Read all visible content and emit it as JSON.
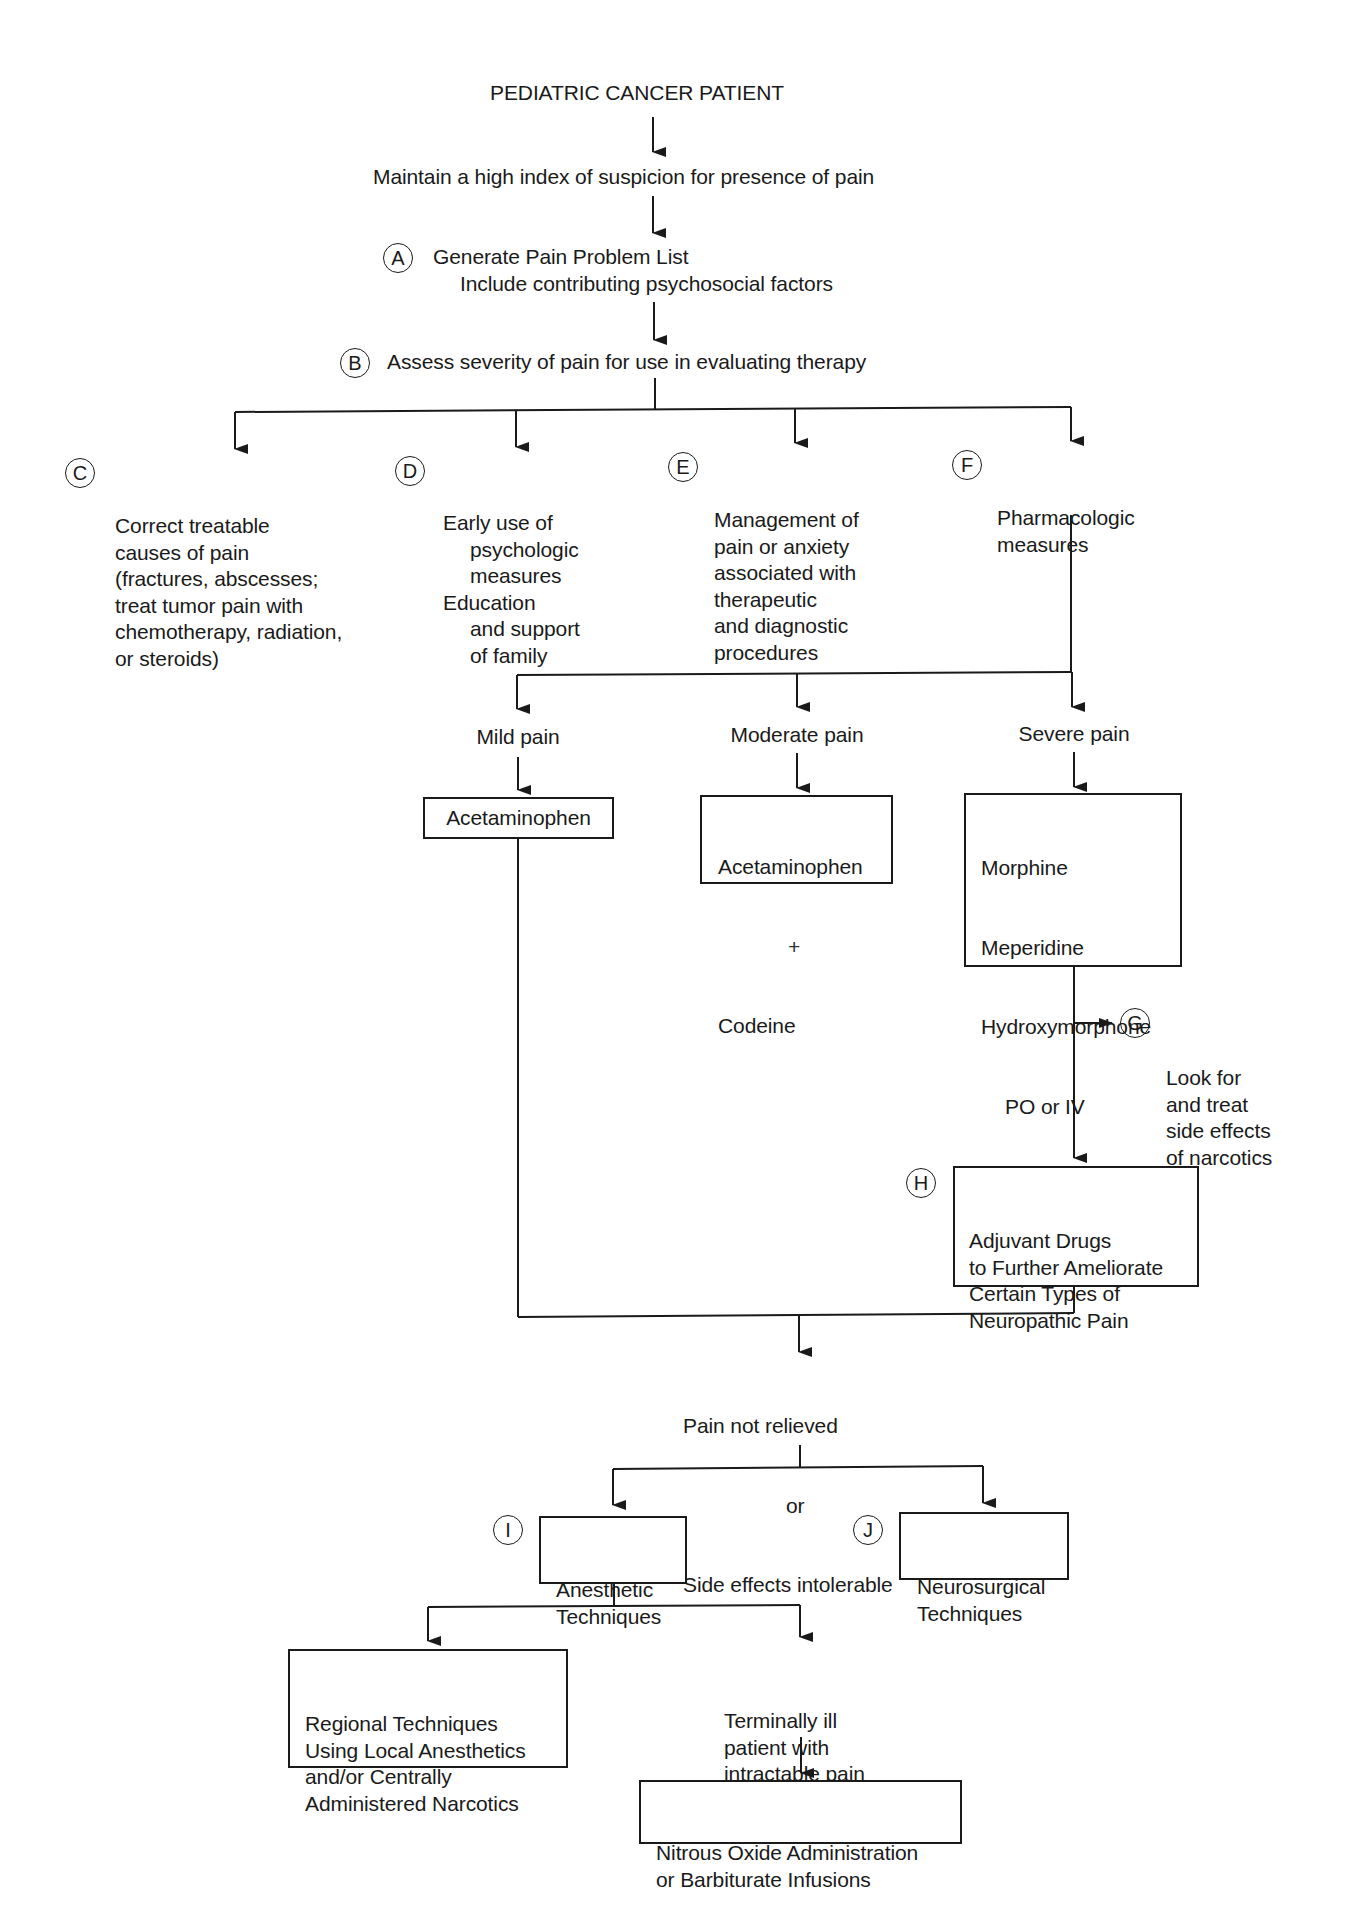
{
  "diagram": {
    "title": "PEDIATRIC CANCER PATIENT",
    "step_index": "Maintain a high index of suspicion for presence of pain",
    "A": {
      "label": "A",
      "line1": "Generate Pain Problem List",
      "line2": "Include contributing psychosocial factors"
    },
    "B": {
      "label": "B",
      "text": "Assess severity of pain for use in evaluating therapy"
    },
    "C": {
      "label": "C",
      "lines": [
        "Correct treatable",
        "causes of pain",
        "(fractures, abscesses;",
        "treat tumor pain with",
        "chemotherapy, radiation,",
        "or steroids)"
      ]
    },
    "D": {
      "label": "D",
      "lines": [
        "Early use of",
        "psychologic",
        "measures",
        "Education",
        "and support",
        "of family"
      ]
    },
    "E": {
      "label": "E",
      "lines": [
        "Management of",
        "pain or anxiety",
        "associated with",
        "therapeutic",
        "and diagnostic",
        "procedures"
      ]
    },
    "F": {
      "label": "F",
      "lines": [
        "Pharmacologic",
        "measures"
      ]
    },
    "severity": {
      "mild": {
        "label": "Mild pain",
        "drug": "Acetaminophen"
      },
      "moderate": {
        "label": "Moderate pain",
        "drug_lines": [
          "Acetaminophen",
          "+",
          "Codeine"
        ]
      },
      "severe": {
        "label": "Severe pain",
        "drug_lines": [
          "Morphine",
          "Meperidine",
          "Hydroxymorphone",
          "PO or IV",
          "or",
          "Fentanyl IV"
        ]
      }
    },
    "G": {
      "label": "G",
      "lines": [
        "Look for",
        "and treat",
        "side effects",
        "of narcotics"
      ]
    },
    "H": {
      "label": "H",
      "lines": [
        "Adjuvant Drugs",
        "to Further Ameliorate",
        "Certain Types of",
        "Neuropathic Pain"
      ]
    },
    "not_relieved": {
      "lines": [
        "Pain not relieved",
        "or",
        "Side effects intolerable"
      ]
    },
    "I": {
      "label": "I",
      "lines": [
        "Anesthetic",
        "Techniques"
      ]
    },
    "J": {
      "label": "J",
      "lines": [
        "Neurosurgical",
        "Techniques"
      ]
    },
    "regional": {
      "lines": [
        "Regional Techniques",
        "Using Local Anesthetics",
        "and/or Centrally",
        "Administered Narcotics"
      ]
    },
    "terminal": {
      "lines": [
        "Terminally ill",
        "patient with",
        "intractable pain"
      ]
    },
    "final": {
      "lines": [
        "Nitrous Oxide Administration",
        "or Barbiturate Infusions"
      ]
    }
  },
  "colors": {
    "ink": "#1a1a1a",
    "background": "#ffffff"
  }
}
